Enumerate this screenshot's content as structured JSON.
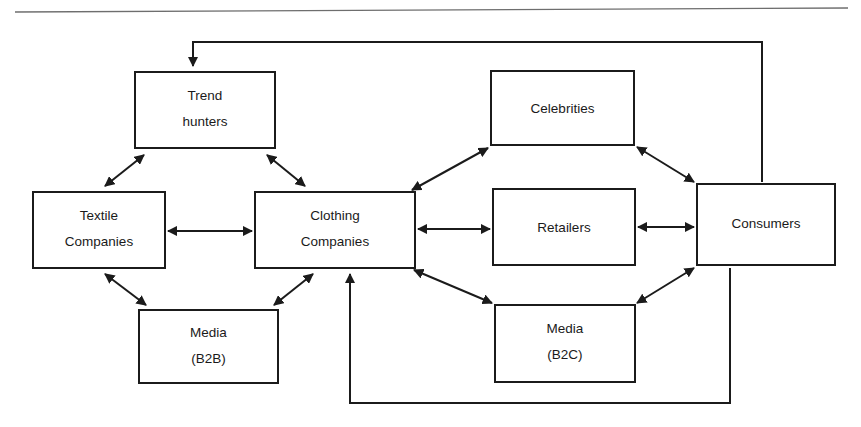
{
  "figure": {
    "background_color": "#ffffff",
    "line_color": "#1b1b1b",
    "rule_color": "#6e6e6e"
  },
  "nodes": [
    {
      "id": "trend_hunters",
      "line1": "Trend",
      "line2": "hunters",
      "x": 135,
      "y": 72,
      "w": 140,
      "h": 76
    },
    {
      "id": "celebrities",
      "line1": "Celebrities",
      "line2": "",
      "x": 491,
      "y": 71,
      "w": 143,
      "h": 74
    },
    {
      "id": "textile_companies",
      "line1": "Textile",
      "line2": "Companies",
      "x": 33,
      "y": 192,
      "w": 132,
      "h": 76
    },
    {
      "id": "clothing_companies",
      "line1": "Clothing",
      "line2": "Companies",
      "x": 255,
      "y": 192,
      "w": 160,
      "h": 76
    },
    {
      "id": "retailers",
      "line1": "Retailers",
      "line2": "",
      "x": 493,
      "y": 189,
      "w": 142,
      "h": 76
    },
    {
      "id": "consumers",
      "line1": "Consumers",
      "line2": "",
      "x": 697,
      "y": 184,
      "w": 138,
      "h": 81
    },
    {
      "id": "media_b2b",
      "line1": "Media",
      "line2": "(B2B)",
      "x": 139,
      "y": 310,
      "w": 139,
      "h": 73
    },
    {
      "id": "media_b2c",
      "line1": "Media",
      "line2": "(B2C)",
      "x": 495,
      "y": 305,
      "w": 140,
      "h": 77
    }
  ],
  "edges": [
    {
      "id": "trend-textile",
      "from": "trend_hunters",
      "to": "textile_companies",
      "arrows": "both",
      "kind": "diagonal"
    },
    {
      "id": "trend-clothing",
      "from": "trend_hunters",
      "to": "clothing_companies",
      "arrows": "both",
      "kind": "diagonal"
    },
    {
      "id": "textile-clothing",
      "from": "textile_companies",
      "to": "clothing_companies",
      "arrows": "both",
      "kind": "horizontal"
    },
    {
      "id": "textile-mediab2b",
      "from": "textile_companies",
      "to": "media_b2b",
      "arrows": "both",
      "kind": "diagonal"
    },
    {
      "id": "mediab2b-clothing",
      "from": "media_b2b",
      "to": "clothing_companies",
      "arrows": "both",
      "kind": "diagonal"
    },
    {
      "id": "clothing-celebrities",
      "from": "clothing_companies",
      "to": "celebrities",
      "arrows": "both",
      "kind": "diagonal"
    },
    {
      "id": "clothing-retailers",
      "from": "clothing_companies",
      "to": "retailers",
      "arrows": "both",
      "kind": "horizontal"
    },
    {
      "id": "clothing-mediab2c",
      "from": "clothing_companies",
      "to": "media_b2c",
      "arrows": "both",
      "kind": "diagonal"
    },
    {
      "id": "celebrities-consumers",
      "from": "celebrities",
      "to": "consumers",
      "arrows": "both",
      "kind": "diagonal"
    },
    {
      "id": "retailers-consumers",
      "from": "retailers",
      "to": "consumers",
      "arrows": "both",
      "kind": "horizontal"
    },
    {
      "id": "mediab2c-consumers",
      "from": "media_b2c",
      "to": "consumers",
      "arrows": "both",
      "kind": "diagonal"
    },
    {
      "id": "consumers-trend-feedback",
      "from": "consumers",
      "to": "trend_hunters",
      "arrows": "to",
      "kind": "orthogonal-top"
    },
    {
      "id": "consumers-clothing-feedback",
      "from": "consumers",
      "to": "clothing_companies",
      "arrows": "to",
      "kind": "orthogonal-bottom"
    }
  ],
  "rule": {
    "x1": 15,
    "y1": 12,
    "x2": 848,
    "y2": 8
  }
}
